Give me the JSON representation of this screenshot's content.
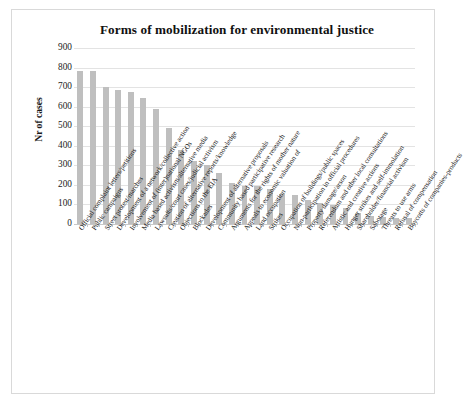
{
  "chart_data": {
    "type": "bar",
    "title": "Forms of mobilization for environmental justice",
    "xlabel": "",
    "ylabel": "Nr of cases",
    "ylim": [
      0,
      900
    ],
    "ytick_labels": [
      "900",
      "800",
      "700",
      "600",
      "500",
      "400",
      "300",
      "200",
      "100",
      "0"
    ],
    "ytick_values": [
      900,
      800,
      700,
      600,
      500,
      400,
      300,
      200,
      100,
      0
    ],
    "grid": true,
    "legend": "none",
    "bar_color": "#bfbfbf",
    "categories": [
      "Official complaint letters/petitions",
      "Public campaigns",
      "Street protest/marches",
      "Development of a network/collective action",
      "Involvement of (inter)national NGOs",
      "Media based activism/alternative media",
      "Lawsuits/court cases/judicial activism",
      "Creation of alternative reports/knowledge",
      "Objections to the EIA",
      "Blockades",
      "Development of alternative proposals",
      "Community based participative research",
      "Arguments for the rights of mother nature",
      "Appeals to economic valuation of",
      "Land occupation",
      "Strikes",
      "Occupation of buildings/public spaces",
      "Non-participation in official procedures",
      "Property damage/arson",
      "Referendum and other local consultations",
      "Artistic and creative actions",
      "Hunger strikes and self-immolation",
      "Shareholder/financial activism",
      "Sabotage",
      "Threats to use arms",
      "Refusal of compensation",
      "Boycotts of companies-products"
    ],
    "values": [
      785,
      780,
      702,
      685,
      677,
      645,
      587,
      490,
      380,
      323,
      303,
      260,
      212,
      196,
      193,
      178,
      152,
      150,
      122,
      108,
      95,
      82,
      58,
      42,
      38,
      33,
      30
    ]
  }
}
